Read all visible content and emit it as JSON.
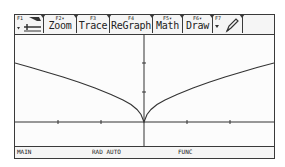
{
  "toolbar": {
    "tabs": [
      {
        "fkey": "F1",
        "label": "tools-icon",
        "dropdown": true
      },
      {
        "fkey": "F2▾",
        "label": "Zoom"
      },
      {
        "fkey": "F3",
        "label": "Trace"
      },
      {
        "fkey": "F4",
        "label": "ReGraph"
      },
      {
        "fkey": "F5▾",
        "label": "Math"
      },
      {
        "fkey": "F6▾",
        "label": "Draw"
      },
      {
        "fkey": "F7",
        "label": "pencil-icon",
        "dropdown": true
      },
      {
        "fkey": "",
        "label": ""
      }
    ]
  },
  "status": {
    "folder": "MAIN",
    "mode": "RAD AUTO",
    "graph_mode": "FUNC"
  },
  "graph": {
    "function_shape": "y = sqrt(|x|)",
    "line_color": "#333333",
    "axis_color": "#333333"
  }
}
